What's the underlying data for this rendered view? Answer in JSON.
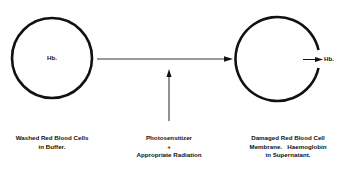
{
  "diagram": {
    "type": "process-flow",
    "nodes": {
      "intact_cell": {
        "inner_label": "Hb.",
        "caption_lines": [
          "Washed Red Blood Cells",
          "in Buffer."
        ]
      },
      "damaged_cell": {
        "released_label": "Hb.",
        "caption_lines": [
          "Damaged Red Blood Cell",
          "Membrane.   Haemoglobin",
          "in Supernatant."
        ]
      }
    },
    "input": {
      "caption_lines": [
        "Photosensitizer",
        "+",
        "Appropriate Radiation"
      ]
    },
    "colors": {
      "stroke": "#111111",
      "arrow": "#333333",
      "background": "#ffffff"
    }
  }
}
